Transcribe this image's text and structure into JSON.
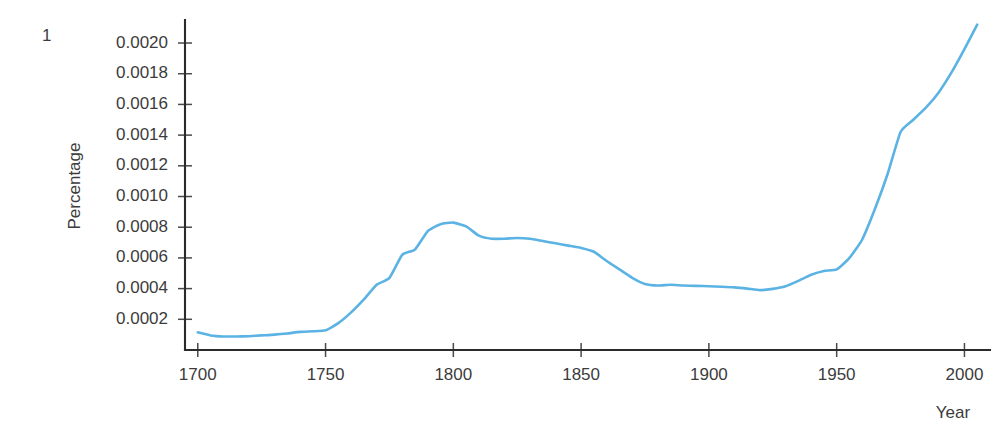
{
  "figure": {
    "number_label": "1",
    "accent_color": "#5bb3e4",
    "axis_color": "#2b2b2b",
    "text_color": "#3c3c3c",
    "background": "#ffffff"
  },
  "chart_data": {
    "type": "line",
    "title": "",
    "subtitle": "",
    "xlabel": "Year",
    "ylabel": "Percentage",
    "xlim": [
      1695,
      2010
    ],
    "ylim": [
      0.0,
      0.00215
    ],
    "grid": false,
    "legend": null,
    "x_ticks": [
      1700,
      1750,
      1800,
      1850,
      1900,
      1950,
      2000
    ],
    "x_tick_labels": [
      "1700",
      "1750",
      "1800",
      "1850",
      "1900",
      "1950",
      "2000"
    ],
    "y_ticks": [
      0.0002,
      0.0004,
      0.0006,
      0.0008,
      0.001,
      0.0012,
      0.0014,
      0.0016,
      0.0018,
      0.002
    ],
    "y_tick_labels": [
      "0.0002",
      "0.0004",
      "0.0006",
      "0.0008",
      "0.0010",
      "0.0012",
      "0.0014",
      "0.0016",
      "0.0018",
      "0.0020"
    ],
    "series": [
      {
        "name": "Percentage",
        "color": "#5bb3e4",
        "x": [
          1700,
          1705,
          1710,
          1715,
          1720,
          1725,
          1730,
          1735,
          1740,
          1745,
          1750,
          1755,
          1760,
          1765,
          1770,
          1775,
          1780,
          1785,
          1790,
          1795,
          1800,
          1805,
          1810,
          1815,
          1820,
          1825,
          1830,
          1835,
          1840,
          1845,
          1850,
          1855,
          1860,
          1865,
          1870,
          1875,
          1880,
          1885,
          1890,
          1895,
          1900,
          1905,
          1910,
          1915,
          1920,
          1925,
          1930,
          1935,
          1940,
          1945,
          1950,
          1955,
          1960,
          1965,
          1970,
          1975,
          1980,
          1985,
          1990,
          1995,
          2000,
          2005
        ],
        "y": [
          0.000115,
          9.5e-05,
          8.8e-05,
          8.8e-05,
          9e-05,
          9.5e-05,
          0.0001,
          0.000108,
          0.000118,
          0.000122,
          0.000128,
          0.000175,
          0.000245,
          0.00033,
          0.000425,
          0.00047,
          0.00062,
          0.000655,
          0.000775,
          0.00082,
          0.00083,
          0.000805,
          0.000745,
          0.000725,
          0.000725,
          0.00073,
          0.000725,
          0.00071,
          0.000695,
          0.00068,
          0.000665,
          0.00064,
          0.00058,
          0.000525,
          0.00047,
          0.00043,
          0.00042,
          0.000425,
          0.00042,
          0.000418,
          0.000415,
          0.000412,
          0.000408,
          0.0004,
          0.00039,
          0.000398,
          0.000415,
          0.00045,
          0.00049,
          0.000515,
          0.000525,
          0.0006,
          0.00072,
          0.00092,
          0.00115,
          0.00142,
          0.0015,
          0.00158,
          0.00168,
          0.00181,
          0.00196,
          0.00212
        ]
      }
    ]
  }
}
